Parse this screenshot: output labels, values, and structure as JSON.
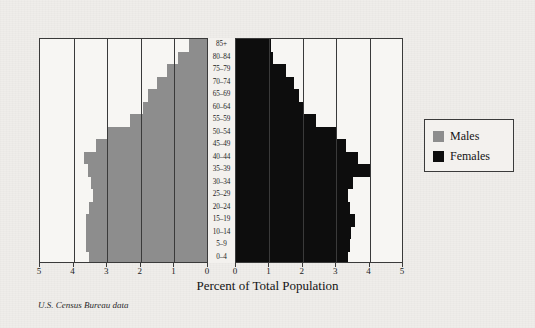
{
  "figure": {
    "x_axis_title": "Percent of Total Population",
    "source_note": "U.S. Census Bureau data"
  },
  "legend": {
    "items": [
      {
        "label": "Males",
        "color": "#8d8d8d",
        "swatch_name": "males-swatch"
      },
      {
        "label": "Females",
        "color": "#0d0d0d",
        "swatch_name": "females-swatch"
      }
    ]
  },
  "axis": {
    "left_ticks": [
      "5",
      "4",
      "3",
      "2",
      "1",
      "0"
    ],
    "right_ticks": [
      "0",
      "1",
      "2",
      "3",
      "4",
      "5"
    ]
  },
  "chart_data": {
    "type": "bar",
    "subtype": "population-pyramid",
    "title": "",
    "xlabel": "Percent of Total Population",
    "ylabel": "",
    "xlim": [
      0,
      5
    ],
    "grid": true,
    "legend_position": "right",
    "orientation": "horizontal",
    "categories": [
      "85+",
      "80-84",
      "75-79",
      "70-74",
      "65-69",
      "60-64",
      "55-59",
      "50-54",
      "45-49",
      "40-44",
      "35-39",
      "30-34",
      "25-29",
      "20-24",
      "15-19",
      "10-14",
      "5-9",
      "0-4"
    ],
    "series": [
      {
        "name": "Males",
        "color": "#8d8d8d",
        "side": "left",
        "values": [
          0.55,
          0.85,
          1.2,
          1.5,
          1.75,
          1.9,
          2.3,
          2.95,
          3.3,
          3.65,
          3.55,
          3.45,
          3.4,
          3.5,
          3.6,
          3.6,
          3.6,
          3.5
        ]
      },
      {
        "name": "Females",
        "color": "#0d0d0d",
        "side": "right",
        "values": [
          1.05,
          1.1,
          1.5,
          1.75,
          1.9,
          2.05,
          2.4,
          3.0,
          3.3,
          3.65,
          4.0,
          3.5,
          3.35,
          3.4,
          3.55,
          3.45,
          3.4,
          3.35
        ]
      }
    ]
  }
}
